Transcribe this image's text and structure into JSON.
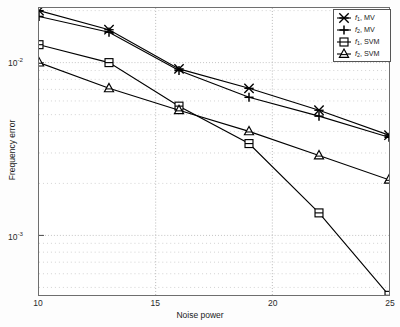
{
  "chart_data": {
    "type": "line",
    "title": "",
    "xlabel": "Noise power",
    "ylabel": "Frequency error",
    "xlim": [
      10,
      25
    ],
    "ylim": [
      0.0004,
      0.022
    ],
    "yscale": "log",
    "xscale": "linear",
    "grid": true,
    "grid_style": "dotted",
    "legend_position": "upper right",
    "xticks": [
      "10",
      "15",
      "20",
      "25"
    ],
    "xtick_values": [
      10,
      15,
      20,
      25
    ],
    "yticks": [
      "10-2",
      "10-3"
    ],
    "ytick_values": [
      0.01,
      0.001
    ],
    "x": [
      10,
      13,
      16,
      19,
      22,
      25
    ],
    "series": [
      {
        "name": "f1, MV",
        "label_base": "f",
        "label_sub": "1",
        "label_suffix": ", MV",
        "marker": "x-star",
        "color": "#000000",
        "values": [
          0.02,
          0.0155,
          0.0092,
          0.0071,
          0.0053,
          0.0038
        ]
      },
      {
        "name": "f2, MV",
        "label_base": "f",
        "label_sub": "2",
        "label_suffix": ", MV",
        "marker": "plus",
        "color": "#000000",
        "values": [
          0.0185,
          0.015,
          0.009,
          0.0063,
          0.0049,
          0.0037
        ]
      },
      {
        "name": "f1, SVM",
        "label_base": "f",
        "label_sub": "1",
        "label_suffix": ", SVM",
        "marker": "square",
        "color": "#000000",
        "values": [
          0.0127,
          0.01,
          0.0056,
          0.0034,
          0.00135,
          0.00045
        ]
      },
      {
        "name": "f2, SVM",
        "label_base": "f",
        "label_sub": "2",
        "label_suffix": ", SVM",
        "marker": "triangle",
        "color": "#000000",
        "values": [
          0.01,
          0.0071,
          0.0053,
          0.004,
          0.0029,
          0.0021
        ]
      }
    ]
  },
  "axes": {
    "xtick_labels": [
      "10",
      "15",
      "20",
      "25"
    ],
    "ytick_mantissa": "10",
    "ytick_exponents": [
      "-2",
      "-3"
    ],
    "xlabel": "Noise power",
    "ylabel": "Frequency error"
  },
  "legend": {
    "entries": [
      {
        "base": "f",
        "sub": "1",
        "suffix": ", MV",
        "marker": "x-star"
      },
      {
        "base": "f",
        "sub": "2",
        "suffix": ", MV",
        "marker": "plus"
      },
      {
        "base": "f",
        "sub": "1",
        "suffix": ", SVM",
        "marker": "square"
      },
      {
        "base": "f",
        "sub": "2",
        "suffix": ", SVM",
        "marker": "triangle"
      }
    ]
  }
}
